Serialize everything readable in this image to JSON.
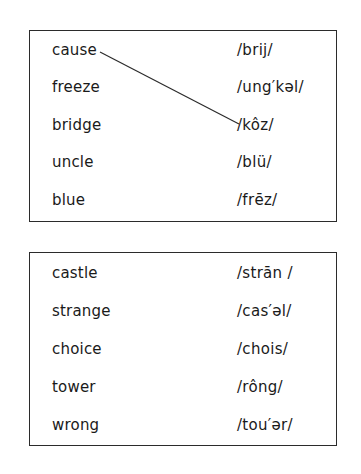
{
  "exercise_1": {
    "words": [
      "cause",
      "freeze",
      "bridge",
      "uncle",
      "blue"
    ],
    "pronunciations": [
      "/brij/",
      "/ung′kəl/",
      "/kôz/",
      "/blü/",
      "/frēz/"
    ],
    "drawn_match": {
      "word": "cause",
      "pronunciation": "/kôz/"
    }
  },
  "exercise_2": {
    "words": [
      "castle",
      "strange",
      "choice",
      "tower",
      "wrong"
    ],
    "pronunciations": [
      "/strān /",
      "/cas′əl/",
      "/chois/",
      "/rông/",
      "/tou′ər/"
    ]
  }
}
